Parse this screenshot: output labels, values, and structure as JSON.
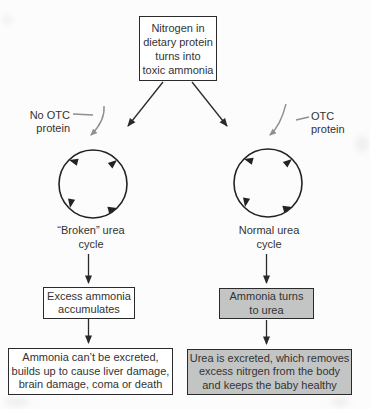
{
  "colors": {
    "background": "#fcfcfc",
    "ink": "#2a2a2a",
    "text": "#333333",
    "pointer_gray": "#8f8f8f",
    "gray_box_fill": "#c3c5c5",
    "white_box_fill": "#ffffff"
  },
  "diagram": {
    "top_box": {
      "lines": [
        "Nitrogen in",
        "dietary protein",
        "turns into",
        "toxic ammonia"
      ]
    },
    "left_branch": {
      "pointer_label": {
        "lines": [
          "No OTC",
          "protein"
        ]
      },
      "cycle_label": {
        "lines": [
          "“Broken” urea",
          "cycle"
        ]
      },
      "mid_box": {
        "lines": [
          "Excess ammonia",
          "accumulates"
        ]
      },
      "bottom_box": {
        "lines": [
          "Ammonia can’t be excreted,",
          "builds up to cause liver damage,",
          "brain damage, coma or death"
        ]
      }
    },
    "right_branch": {
      "pointer_label": {
        "lines": [
          "OTC",
          "protein"
        ]
      },
      "cycle_label": {
        "lines": [
          "Normal urea",
          "cycle"
        ]
      },
      "mid_box": {
        "lines": [
          "Ammonia turns",
          "to urea"
        ]
      },
      "bottom_box": {
        "lines": [
          "Urea is excreted, which removes",
          "excess nitrgen from the body",
          "and keeps the baby healthy"
        ]
      }
    }
  }
}
